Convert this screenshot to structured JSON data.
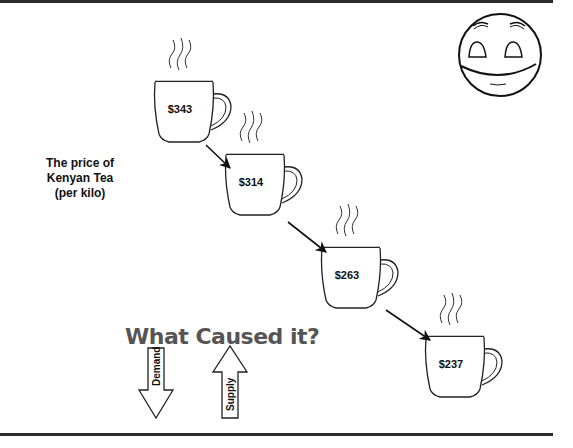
{
  "side_label": {
    "line1": "The price of",
    "line2": "Kenyan Tea",
    "line3": "(per kilo)"
  },
  "cups": [
    {
      "price": "$343"
    },
    {
      "price": "$314"
    },
    {
      "price": "$263"
    },
    {
      "price": "$237"
    }
  ],
  "question": "What Caused it?",
  "arrows": {
    "demand": {
      "label": "Demand",
      "direction": "down"
    },
    "supply": {
      "label": "Supply",
      "direction": "up"
    }
  },
  "icons": {
    "face": "smiley-face-icon",
    "cup": "steaming-mug-icon"
  }
}
